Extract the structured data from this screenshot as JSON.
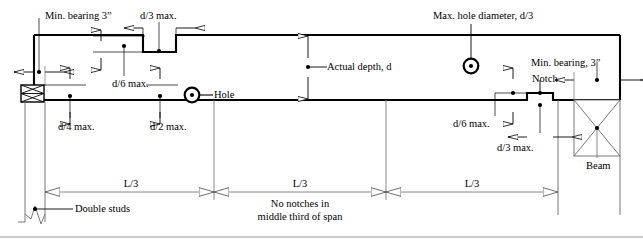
{
  "figure": {
    "kind": "engineering-detail-drawing",
    "stroke_color": "#000000",
    "thin_color": "#5a5a5a",
    "background": "#ffffff"
  },
  "labels": {
    "min_bearing_left": "Min. bearing 3ˮ",
    "d3_max_top": "d/3 max.",
    "max_hole_diameter": "Max. hole diameter, d/3",
    "min_bearing_right": "Min. bearing, 3ˮ",
    "d6_max_top": "d/6 max.",
    "hole": "Hole",
    "actual_depth": "Actual depth, d",
    "notch": "Notch",
    "d4_max": "d/4 max.",
    "d2_max": "d/2 max.",
    "d6_max_bottom": "d/6 max.",
    "d3_max_bottom": "d/3 max.",
    "beam": "Beam",
    "double_studs": "Double studs",
    "span_left": "L/3",
    "span_mid": "L/3",
    "span_right": "L/3",
    "no_notches_line1": "No notches in",
    "no_notches_line2": "middle third of span"
  },
  "dimensions": {
    "span_segments": [
      "L/3",
      "L/3",
      "L/3"
    ],
    "max_hole_diameter_ratio": "d/3",
    "min_bearing_inches": "3",
    "top_notch_depth_limit": "d/6",
    "top_notch_length_limit": "d/3",
    "end_notch_depth_limit_left": "d/4",
    "end_notch_length_limit_left": "d/2",
    "end_notch_depth_limit_right": "d/6",
    "end_notch_length_limit_right": "d/3"
  }
}
